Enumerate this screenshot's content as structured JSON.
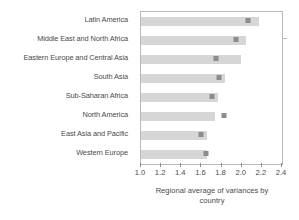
{
  "chart_data": {
    "type": "bar",
    "title": "",
    "subtitle": "",
    "xlabel": "Regional average of variances by country",
    "ylabel": "",
    "xlim": [
      1.0,
      2.4
    ],
    "xticks": [
      1.0,
      1.2,
      1.4,
      1.6,
      1.8,
      2.0,
      2.2,
      2.4
    ],
    "xticklabels": [
      "1.0",
      "1.2",
      "1.4",
      "1.6",
      "1.8",
      "2.0",
      "2.2",
      "2.4"
    ],
    "grid": false,
    "legend": null,
    "orientation": "horizontal",
    "bar_color": "#d6d6d6",
    "marker_color": "#8c8c8c",
    "marker_shape": "square",
    "categories": [
      "Latin America",
      "Middle East and North Africa",
      "Eastern Europe and Central Asia",
      "South Asia",
      "Sub-Saharan Africa",
      "North America",
      "East Asia and Pacific",
      "Western Europe"
    ],
    "series": [
      {
        "name": "Regional average of variances by country",
        "values": [
          2.17,
          2.04,
          1.99,
          1.83,
          1.76,
          1.73,
          1.66,
          1.66
        ]
      },
      {
        "name": "Marker",
        "values": [
          2.06,
          1.94,
          1.74,
          1.77,
          1.7,
          1.82,
          1.6,
          1.65
        ]
      }
    ]
  },
  "axis_title": {
    "line1": "Regional average of variances by",
    "line2": "country"
  }
}
